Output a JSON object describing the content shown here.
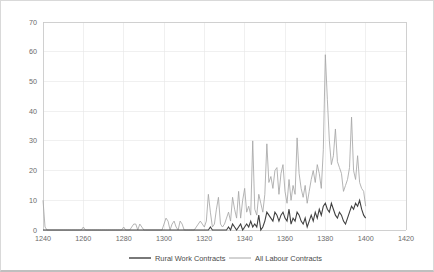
{
  "chart_data": {
    "type": "line",
    "title": "",
    "subtitle": "",
    "xlabel": "",
    "ylabel": "",
    "xlim": [
      1240,
      1420
    ],
    "ylim": [
      0,
      70
    ],
    "grid": true,
    "legend_position": "bottom",
    "x_ticks": [
      "1240",
      "1260",
      "1280",
      "1300",
      "1320",
      "1340",
      "1360",
      "1380",
      "1400",
      "1420"
    ],
    "y_ticks": [
      "0",
      "10",
      "20",
      "30",
      "40",
      "50",
      "60",
      "70"
    ],
    "x_tick_values": [
      1240,
      1260,
      1280,
      1300,
      1320,
      1340,
      1360,
      1380,
      1400,
      1420
    ],
    "y_tick_values": [
      0,
      10,
      20,
      30,
      40,
      50,
      60,
      70
    ],
    "colors": {
      "rural_work_contracts": "#404040",
      "all_labour_contracts": "#a6a6a6",
      "gridline": "#e6e6e6",
      "axis": "#c8c8c8",
      "tick_label": "#6b6b6b",
      "frame_border": "#d9d9d9"
    },
    "x": [
      1240,
      1241,
      1242,
      1243,
      1244,
      1245,
      1246,
      1247,
      1248,
      1249,
      1250,
      1251,
      1252,
      1253,
      1254,
      1255,
      1256,
      1257,
      1258,
      1259,
      1260,
      1261,
      1262,
      1263,
      1264,
      1265,
      1266,
      1267,
      1268,
      1269,
      1270,
      1271,
      1272,
      1273,
      1274,
      1275,
      1276,
      1277,
      1278,
      1279,
      1280,
      1281,
      1282,
      1283,
      1284,
      1285,
      1286,
      1287,
      1288,
      1289,
      1290,
      1291,
      1292,
      1293,
      1294,
      1295,
      1296,
      1297,
      1298,
      1299,
      1300,
      1301,
      1302,
      1303,
      1304,
      1305,
      1306,
      1307,
      1308,
      1309,
      1310,
      1311,
      1312,
      1313,
      1314,
      1315,
      1316,
      1317,
      1318,
      1319,
      1320,
      1321,
      1322,
      1323,
      1324,
      1325,
      1326,
      1327,
      1328,
      1329,
      1330,
      1331,
      1332,
      1333,
      1334,
      1335,
      1336,
      1337,
      1338,
      1339,
      1340,
      1341,
      1342,
      1343,
      1344,
      1345,
      1346,
      1347,
      1348,
      1349,
      1350,
      1351,
      1352,
      1353,
      1354,
      1355,
      1356,
      1357,
      1358,
      1359,
      1360,
      1361,
      1362,
      1363,
      1364,
      1365,
      1366,
      1367,
      1368,
      1369,
      1370,
      1371,
      1372,
      1373,
      1374,
      1375,
      1376,
      1377,
      1378,
      1379,
      1380,
      1381,
      1382,
      1383,
      1384,
      1385,
      1386,
      1387,
      1388,
      1389,
      1390,
      1391,
      1392,
      1393,
      1394,
      1395,
      1396,
      1397,
      1398,
      1399,
      1400
    ],
    "series": [
      {
        "name": "Rural Work Contracts",
        "color": "#404040",
        "values": [
          0,
          0,
          0,
          0,
          0,
          0,
          0,
          0,
          0,
          0,
          0,
          0,
          0,
          0,
          0,
          0,
          0,
          0,
          0,
          0,
          0,
          0,
          0,
          0,
          0,
          0,
          0,
          0,
          0,
          0,
          0,
          0,
          0,
          0,
          0,
          0,
          0,
          0,
          0,
          0,
          0,
          0,
          0,
          0,
          0,
          0,
          0,
          0,
          0,
          0,
          0,
          0,
          0,
          0,
          0,
          0,
          0,
          0,
          0,
          0,
          0,
          0,
          0,
          0,
          0,
          0,
          0,
          0,
          0,
          0,
          0,
          0,
          0,
          0,
          0,
          0,
          0,
          0,
          0,
          0,
          0,
          0,
          0,
          1,
          0,
          0,
          0,
          0,
          0,
          0,
          0,
          0,
          1,
          0,
          2,
          1,
          0,
          1,
          2,
          0,
          1,
          2,
          1,
          3,
          1,
          2,
          1,
          5,
          0,
          1,
          3,
          6,
          5,
          4,
          3,
          6,
          5,
          3,
          5,
          6,
          4,
          3,
          7,
          2,
          4,
          3,
          6,
          5,
          3,
          2,
          4,
          1,
          3,
          5,
          3,
          6,
          4,
          7,
          5,
          8,
          9,
          7,
          6,
          9,
          7,
          5,
          4,
          6,
          5,
          3,
          2,
          4,
          6,
          8,
          7,
          9,
          8,
          10,
          7,
          5,
          4
        ]
      },
      {
        "name": "All Labour Contracts",
        "color": "#a6a6a6",
        "values": [
          10,
          1,
          0,
          0,
          0,
          0,
          0,
          0,
          0,
          0,
          0,
          0,
          0,
          0,
          0,
          0,
          0,
          0,
          0,
          0,
          1,
          0,
          0,
          0,
          0,
          0,
          0,
          0,
          0,
          0,
          0,
          0,
          0,
          0,
          0,
          0,
          0,
          0,
          0,
          0,
          1,
          0,
          0,
          0,
          1,
          2,
          2,
          0,
          2,
          1,
          0,
          0,
          0,
          0,
          0,
          0,
          0,
          0,
          0,
          0,
          2,
          4,
          3,
          0,
          2,
          3,
          1,
          0,
          3,
          2,
          0,
          0,
          0,
          0,
          0,
          0,
          1,
          2,
          3,
          2,
          1,
          3,
          12,
          6,
          1,
          2,
          7,
          11,
          2,
          1,
          2,
          4,
          6,
          3,
          11,
          7,
          4,
          13,
          4,
          10,
          14,
          6,
          8,
          5,
          30,
          7,
          5,
          12,
          9,
          6,
          12,
          29,
          16,
          18,
          14,
          20,
          21,
          12,
          19,
          22,
          13,
          9,
          17,
          10,
          15,
          12,
          31,
          19,
          14,
          11,
          15,
          9,
          13,
          17,
          20,
          16,
          22,
          19,
          14,
          27,
          59,
          44,
          30,
          22,
          25,
          34,
          23,
          21,
          19,
          13,
          15,
          17,
          21,
          38,
          20,
          17,
          25,
          16,
          14,
          13,
          8
        ]
      }
    ],
    "legend": [
      {
        "label": "Rural Work Contracts",
        "color": "#404040"
      },
      {
        "label": "All Labour Contracts",
        "color": "#a6a6a6"
      }
    ]
  }
}
